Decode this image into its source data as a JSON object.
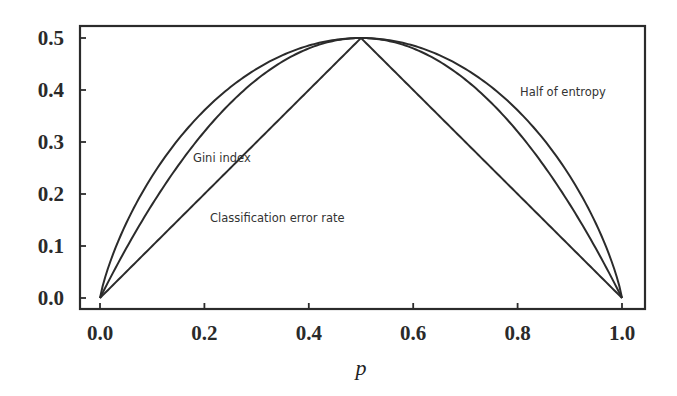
{
  "chart_data": {
    "type": "line",
    "title": "",
    "xlabel": "p",
    "ylabel": "",
    "xlim": [
      -0.04,
      1.04
    ],
    "ylim": [
      -0.02,
      0.52
    ],
    "grid": false,
    "legend": "none (inline annotations)",
    "x_ticks": [
      "0.0",
      "0.2",
      "0.4",
      "0.6",
      "0.8",
      "1.0"
    ],
    "y_ticks": [
      "0.0",
      "0.1",
      "0.2",
      "0.3",
      "0.4",
      "0.5"
    ],
    "x": [
      0.0,
      0.05,
      0.1,
      0.15,
      0.2,
      0.25,
      0.3,
      0.35,
      0.4,
      0.45,
      0.5,
      0.55,
      0.6,
      0.65,
      0.7,
      0.75,
      0.8,
      0.85,
      0.9,
      0.95,
      1.0
    ],
    "series": [
      {
        "name": "Half of entropy",
        "formula": "-0.5*(p*log2(p) + (1-p)*log2(1-p))",
        "values": [
          0.0,
          0.143,
          0.234,
          0.305,
          0.361,
          0.406,
          0.441,
          0.467,
          0.485,
          0.496,
          0.5,
          0.496,
          0.485,
          0.467,
          0.441,
          0.406,
          0.361,
          0.305,
          0.234,
          0.143,
          0.0
        ]
      },
      {
        "name": "Gini index",
        "formula": "2*p*(1-p)",
        "values": [
          0.0,
          0.095,
          0.18,
          0.255,
          0.32,
          0.375,
          0.42,
          0.455,
          0.48,
          0.495,
          0.5,
          0.495,
          0.48,
          0.455,
          0.42,
          0.375,
          0.32,
          0.255,
          0.18,
          0.095,
          0.0
        ]
      },
      {
        "name": "Classification error rate",
        "formula": "1 - max(p, 1-p)",
        "values": [
          0.0,
          0.05,
          0.1,
          0.15,
          0.2,
          0.25,
          0.3,
          0.35,
          0.4,
          0.45,
          0.5,
          0.45,
          0.4,
          0.35,
          0.3,
          0.25,
          0.2,
          0.15,
          0.1,
          0.05,
          0.0
        ]
      }
    ],
    "annotations": [
      {
        "text": "Half of entropy",
        "x": 0.81,
        "y": 0.42
      },
      {
        "text": "Gini index",
        "x": 0.19,
        "y": 0.28
      },
      {
        "text": "Classification error rate",
        "x": 0.26,
        "y": 0.155
      }
    ]
  },
  "labels": {
    "x_axis_title": "p",
    "half_entropy": "Half of entropy",
    "gini": "Gini index",
    "error_rate": "Classification error rate"
  }
}
